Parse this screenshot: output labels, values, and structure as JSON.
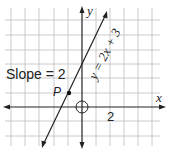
{
  "figure": {
    "slope_label": "Slope = 2",
    "point_label": "P",
    "equation_label": "y = 2x + 3",
    "x_axis_label": "x",
    "y_axis_label": "y",
    "tick_label": "2"
  },
  "colors": {
    "grid": "#b8b8b8",
    "axes": "#222222",
    "line": "#222222"
  }
}
